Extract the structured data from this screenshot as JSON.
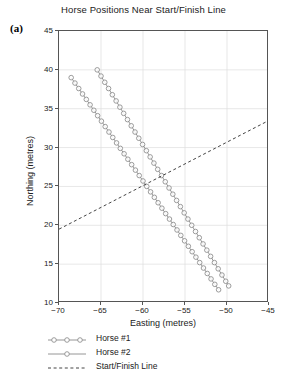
{
  "panel_label": "(a)",
  "chart_data": {
    "type": "line",
    "title": "Horse Positions Near Start/Finish Line",
    "xlabel": "Easting (metres)",
    "ylabel": "Northing (metres)",
    "xlim": [
      -70,
      -45
    ],
    "ylim": [
      10,
      45
    ],
    "xticks": [
      -70,
      -65,
      -60,
      -55,
      -50,
      -45
    ],
    "yticks": [
      10,
      15,
      20,
      25,
      30,
      35,
      40,
      45
    ],
    "xtick_labels": [
      "−70",
      "−65",
      "−60",
      "−55",
      "−50",
      "−45"
    ],
    "ytick_labels": [
      "10",
      "15",
      "20",
      "25",
      "30",
      "35",
      "40",
      "45"
    ],
    "grid": true,
    "legend_position": "below-left",
    "series": [
      {
        "name": "Horse #1",
        "marker": "circle-open",
        "linestyle": "solid",
        "color": "#8a8a8a",
        "x": [
          -65.45,
          -65.0,
          -64.55,
          -64.1,
          -63.65,
          -63.2,
          -62.75,
          -62.3,
          -61.85,
          -61.4,
          -60.95,
          -60.5,
          -60.05,
          -59.6,
          -59.15,
          -58.7,
          -58.25,
          -57.8,
          -57.35,
          -56.9,
          -56.45,
          -56.0,
          -55.55,
          -55.1,
          -54.65,
          -54.2,
          -53.75,
          -53.3,
          -52.85,
          -52.4,
          -51.95,
          -51.5,
          -51.05,
          -50.6,
          -50.15,
          -49.8
        ],
        "y": [
          40.0,
          39.2,
          38.4,
          37.6,
          36.8,
          36.0,
          35.2,
          34.4,
          33.6,
          32.8,
          32.0,
          31.2,
          30.4,
          29.6,
          28.8,
          28.0,
          27.2,
          26.4,
          25.6,
          24.8,
          24.0,
          23.2,
          22.4,
          21.6,
          20.8,
          20.0,
          19.2,
          18.4,
          17.6,
          16.8,
          16.0,
          15.2,
          14.4,
          13.6,
          12.8,
          12.2
        ]
      },
      {
        "name": "Horse #2",
        "marker": "circle-open",
        "linestyle": "solid",
        "color": "#8a8a8a",
        "x": [
          -68.55,
          -68.1,
          -67.65,
          -67.2,
          -66.75,
          -66.3,
          -65.85,
          -65.4,
          -64.95,
          -64.5,
          -64.05,
          -63.6,
          -63.15,
          -62.7,
          -62.25,
          -61.8,
          -61.35,
          -60.9,
          -60.45,
          -60.0,
          -59.55,
          -59.1,
          -58.65,
          -58.2,
          -57.75,
          -57.3,
          -56.85,
          -56.4,
          -55.95,
          -55.5,
          -55.05,
          -54.6,
          -54.15,
          -53.7,
          -53.25,
          -52.8,
          -52.35,
          -51.9,
          -51.45,
          -51.0
        ],
        "y": [
          39.0,
          38.3,
          37.6,
          36.9,
          36.2,
          35.5,
          34.8,
          34.1,
          33.4,
          32.7,
          32.0,
          31.3,
          30.6,
          29.9,
          29.2,
          28.5,
          27.8,
          27.1,
          26.4,
          25.7,
          25.0,
          24.3,
          23.6,
          22.9,
          22.2,
          21.5,
          20.8,
          20.1,
          19.4,
          18.7,
          18.0,
          17.3,
          16.6,
          15.9,
          15.2,
          14.5,
          13.8,
          13.1,
          12.4,
          11.7
        ]
      },
      {
        "name": "Start/Finish Line",
        "marker": "none",
        "linestyle": "dashed",
        "color": "#444444",
        "x": [
          -70,
          -45
        ],
        "y": [
          19.5,
          33.5
        ]
      }
    ]
  }
}
